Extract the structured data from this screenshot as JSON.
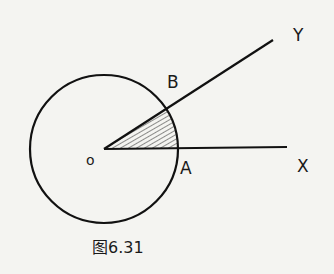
{
  "figure": {
    "caption": "图6.31",
    "labels": {
      "center": "O",
      "point_a": "A",
      "point_b": "B",
      "ray_x": "X",
      "ray_y": "Y"
    },
    "colors": {
      "stroke": "#111111",
      "background": "#f4f4f1"
    }
  }
}
